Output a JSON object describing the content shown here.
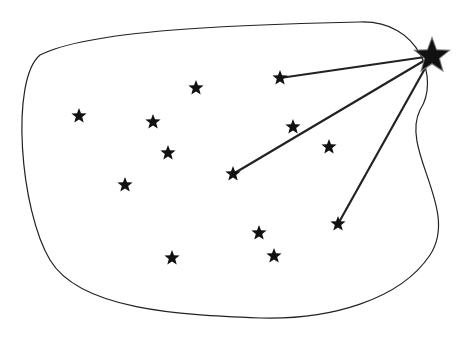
{
  "diagram": {
    "colors": {
      "background": "#ffffff",
      "stroke": "#222222",
      "star": "#111111",
      "big_star_halo": "#777777"
    },
    "boundary_path": "M40,55 C90,30 230,25 360,22 C420,20 440,80 420,110 C400,150 460,210 430,255 C400,300 330,320 260,318 C180,315 80,310 50,260 C20,210 10,80 40,55 Z",
    "big_star": {
      "x": 432,
      "y": 56,
      "r": 17
    },
    "stars": [
      {
        "x": 79,
        "y": 116
      },
      {
        "x": 153,
        "y": 122
      },
      {
        "x": 196,
        "y": 88
      },
      {
        "x": 168,
        "y": 153
      },
      {
        "x": 125,
        "y": 185
      },
      {
        "x": 280,
        "y": 78
      },
      {
        "x": 293,
        "y": 127
      },
      {
        "x": 329,
        "y": 147
      },
      {
        "x": 233,
        "y": 174
      },
      {
        "x": 259,
        "y": 233
      },
      {
        "x": 274,
        "y": 256
      },
      {
        "x": 172,
        "y": 258
      },
      {
        "x": 338,
        "y": 224
      }
    ],
    "connections": [
      5,
      8,
      12
    ]
  }
}
